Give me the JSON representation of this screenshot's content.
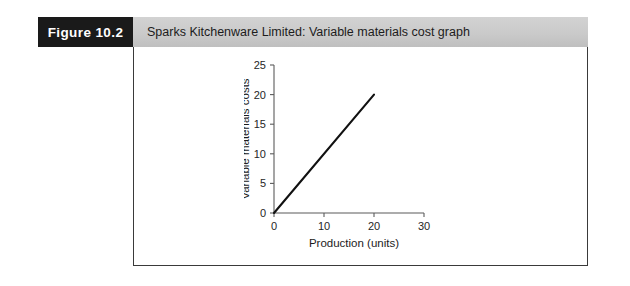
{
  "figure": {
    "label": "Figure 10.2",
    "title": "Sparks Kitchenware Limited: Variable materials cost graph",
    "label_bg": "#1a1a1a",
    "header_bg": "#cacaca",
    "frame_border": "#3a3a3a"
  },
  "chart_data": {
    "type": "line",
    "title": "",
    "xlabel": "Production (units)",
    "ylabel": "Variable materials costs",
    "xlim": [
      0,
      30
    ],
    "ylim": [
      0,
      25
    ],
    "xticks": [
      0,
      10,
      20,
      30
    ],
    "xtick_labels": [
      "0",
      "10",
      "20",
      "30"
    ],
    "yticks": [
      0,
      5,
      10,
      15,
      20,
      25
    ],
    "ytick_labels": [
      "0",
      "5",
      "10",
      "15",
      "20",
      "25"
    ],
    "grid": false,
    "legend": null,
    "series": [
      {
        "name": "Variable materials costs",
        "color": "#111111",
        "x": [
          0,
          20
        ],
        "y": [
          0,
          20
        ]
      }
    ]
  }
}
